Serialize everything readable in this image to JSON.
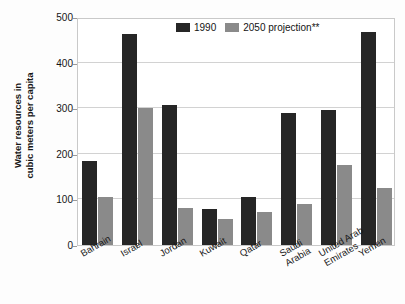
{
  "chart_data": {
    "type": "bar",
    "title": "",
    "xlabel": "",
    "ylabel": "Water resources in cubic meters per capita",
    "ylabel_line1": "Water resources in",
    "ylabel_line2": "cubic meters per capita",
    "ylim": [
      0,
      500
    ],
    "yticks": [
      0,
      100,
      200,
      300,
      400,
      500
    ],
    "ytick_labels": [
      "0",
      "100",
      "200",
      "300",
      "400",
      "500"
    ],
    "grid": true,
    "grid_axis": "y",
    "legend_position": "top-center-inside",
    "categories": [
      "Bahrain",
      "Israel",
      "Jordan",
      "Kuwait",
      "Qatar",
      "Saudi Arabia",
      "United Arab Emirates",
      "Yemen"
    ],
    "category_lines": [
      [
        "Bahrain"
      ],
      [
        "Israel"
      ],
      [
        "Jordan"
      ],
      [
        "Kuwait"
      ],
      [
        "Qatar"
      ],
      [
        "Saudi",
        "Arabia"
      ],
      [
        "United Arab",
        "Emirates"
      ],
      [
        "Yemen"
      ]
    ],
    "series": [
      {
        "name": "1990",
        "color": "#262626",
        "values": [
          185,
          462,
          308,
          78,
          106,
          289,
          297,
          467
        ]
      },
      {
        "name": "2050 projection**",
        "color": "#8a8a8a",
        "values": [
          105,
          300,
          82,
          57,
          72,
          90,
          176,
          126
        ]
      }
    ]
  },
  "legend": {
    "items": [
      {
        "label": "1990",
        "swatch": "dark"
      },
      {
        "label": "2050 projection**",
        "swatch": "light"
      }
    ]
  }
}
